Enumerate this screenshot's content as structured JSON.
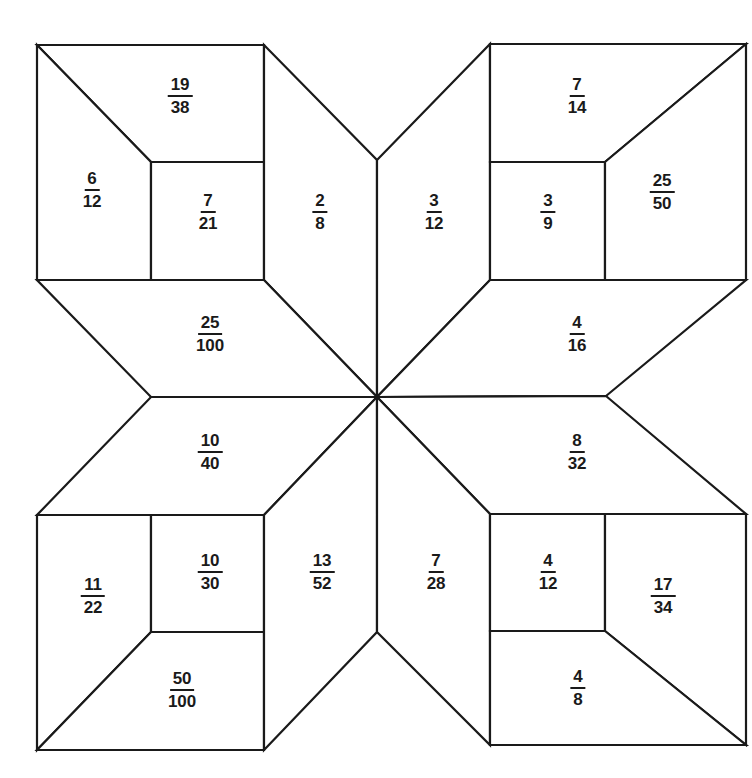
{
  "diagram": {
    "type": "fraction quilt star pattern",
    "line_color": "#1a1a1a",
    "background": "#ffffff",
    "pieces": [
      {
        "id": "tl-top",
        "numerator": "19",
        "denominator": "38",
        "x": 180,
        "y": 96
      },
      {
        "id": "tl-left",
        "numerator": "6",
        "denominator": "12",
        "x": 92,
        "y": 190
      },
      {
        "id": "tl-square",
        "numerator": "7",
        "denominator": "21",
        "x": 208,
        "y": 212
      },
      {
        "id": "top-left-arm",
        "numerator": "2",
        "denominator": "8",
        "x": 320,
        "y": 212
      },
      {
        "id": "top-right-arm",
        "numerator": "3",
        "denominator": "12",
        "x": 434,
        "y": 212
      },
      {
        "id": "tr-top",
        "numerator": "7",
        "denominator": "14",
        "x": 577,
        "y": 96
      },
      {
        "id": "tr-square",
        "numerator": "3",
        "denominator": "9",
        "x": 548,
        "y": 212
      },
      {
        "id": "tr-right",
        "numerator": "25",
        "denominator": "50",
        "x": 662,
        "y": 192
      },
      {
        "id": "left-upper-arm",
        "numerator": "25",
        "denominator": "100",
        "x": 210,
        "y": 334
      },
      {
        "id": "right-upper-arm",
        "numerator": "4",
        "denominator": "16",
        "x": 577,
        "y": 334
      },
      {
        "id": "left-lower-arm",
        "numerator": "10",
        "denominator": "40",
        "x": 210,
        "y": 452
      },
      {
        "id": "right-lower-arm",
        "numerator": "8",
        "denominator": "32",
        "x": 577,
        "y": 452
      },
      {
        "id": "bl-left",
        "numerator": "11",
        "denominator": "22",
        "x": 93,
        "y": 596
      },
      {
        "id": "bl-square",
        "numerator": "10",
        "denominator": "30",
        "x": 210,
        "y": 572
      },
      {
        "id": "bottom-left-arm",
        "numerator": "13",
        "denominator": "52",
        "x": 322,
        "y": 572
      },
      {
        "id": "bottom-right-arm",
        "numerator": "7",
        "denominator": "28",
        "x": 436,
        "y": 572
      },
      {
        "id": "br-square",
        "numerator": "4",
        "denominator": "12",
        "x": 548,
        "y": 572
      },
      {
        "id": "br-right",
        "numerator": "17",
        "denominator": "34",
        "x": 663,
        "y": 596
      },
      {
        "id": "bl-bottom",
        "numerator": "50",
        "denominator": "100",
        "x": 182,
        "y": 690
      },
      {
        "id": "br-bottom",
        "numerator": "4",
        "denominator": "8",
        "x": 578,
        "y": 688
      }
    ]
  }
}
